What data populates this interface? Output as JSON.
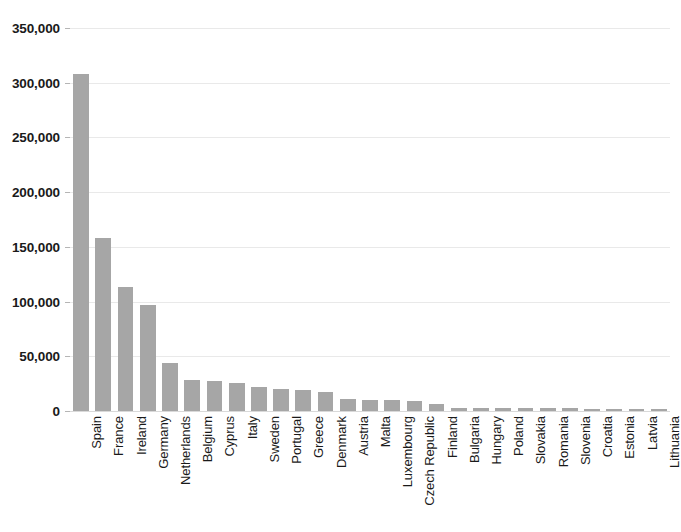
{
  "chart_data": {
    "type": "bar",
    "title": "",
    "xlabel": "",
    "ylabel": "",
    "ylim": [
      0,
      350000
    ],
    "ytick_values": [
      0,
      50000,
      100000,
      150000,
      200000,
      250000,
      300000,
      350000
    ],
    "ytick_labels": [
      "0",
      "50,000",
      "100,000",
      "150,000",
      "200,000",
      "250,000",
      "300,000",
      "350,000"
    ],
    "grid": true,
    "legend": "none",
    "bar_color": "#a6a6a6",
    "gridline_color": "#e9e9e9",
    "axis_text_color": "#1a1a1a",
    "categories": [
      "Spain",
      "France",
      "Ireland",
      "Germany",
      "Netherlands",
      "Belgium",
      "Cyprus",
      "Italy",
      "Sweden",
      "Portugal",
      "Greece",
      "Denmark",
      "Austria",
      "Malta",
      "Luxembourg",
      "Czech Republic",
      "Finland",
      "Bulgaria",
      "Hungary",
      "Poland",
      "Slovakia",
      "Romania",
      "Slovenia",
      "Croatia",
      "Estonia",
      "Latvia",
      "Lithuania"
    ],
    "values": [
      308000,
      158000,
      113000,
      97000,
      44000,
      28000,
      27000,
      26000,
      22000,
      20000,
      19500,
      17000,
      11000,
      10500,
      10000,
      9000,
      6000,
      3000,
      2800,
      2600,
      2500,
      2400,
      2300,
      2200,
      2100,
      2000,
      2000
    ]
  }
}
